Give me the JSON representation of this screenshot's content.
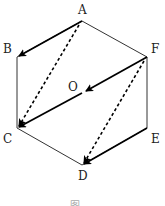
{
  "diagram": {
    "type": "regular hexagon with vectors",
    "labels": {
      "A": "A",
      "B": "B",
      "C": "C",
      "D": "D",
      "E": "E",
      "F": "F",
      "O": "O"
    },
    "caption": "图"
  },
  "vertices": {
    "A": [
      82,
      21
    ],
    "B": [
      17,
      57
    ],
    "C": [
      17,
      128
    ],
    "D": [
      82,
      165
    ],
    "E": [
      147,
      128
    ],
    "F": [
      147,
      57
    ],
    "O": [
      82,
      93
    ]
  },
  "vectors": [
    {
      "from": "A",
      "to": "B",
      "style": "solid"
    },
    {
      "from": "A",
      "to": "C",
      "style": "dashed"
    },
    {
      "from": "F",
      "to": "O",
      "style": "solid"
    },
    {
      "from": "O",
      "to": "C",
      "style": "solid"
    },
    {
      "from": "F",
      "to": "D",
      "style": "dashed"
    },
    {
      "from": "E",
      "to": "D",
      "style": "solid"
    }
  ]
}
